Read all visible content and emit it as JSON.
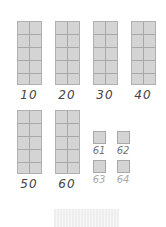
{
  "rods": [
    {
      "label": "10",
      "x": 17,
      "y": 21
    },
    {
      "label": "20",
      "x": 55,
      "y": 21
    },
    {
      "label": "30",
      "x": 93,
      "y": 21
    },
    {
      "label": "40",
      "x": 131,
      "y": 21
    },
    {
      "label": "50",
      "x": 17,
      "y": 110
    },
    {
      "label": "60",
      "x": 55,
      "y": 110
    }
  ],
  "units": [
    {
      "label": "61",
      "x": 93,
      "y": 131,
      "faint": false
    },
    {
      "label": "62",
      "x": 117,
      "y": 131,
      "faint": false
    },
    {
      "label": "63",
      "x": 93,
      "y": 160,
      "faint": true
    },
    {
      "label": "64",
      "x": 117,
      "y": 160,
      "faint": true
    }
  ],
  "colors": {
    "block": "#d4d4d4",
    "grid": "#a8a8a8",
    "label": "#444444"
  }
}
